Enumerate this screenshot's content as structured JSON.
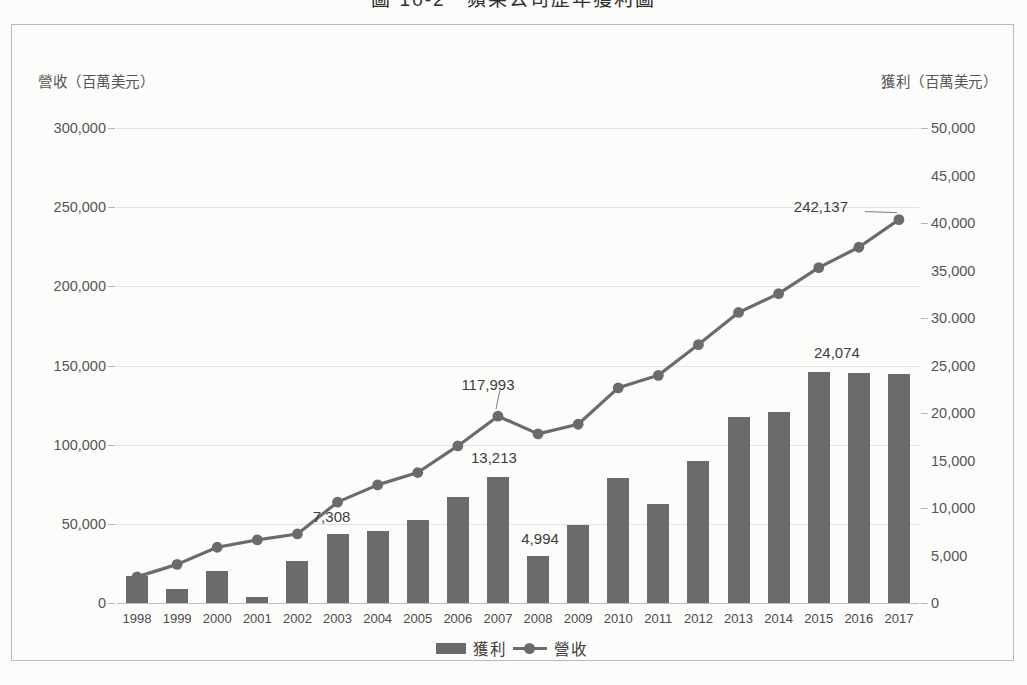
{
  "page": {
    "title_fragment": "圖 10-2　蘋果公司歷年獲利圖"
  },
  "axes": {
    "left_title": "營收（百萬美元）",
    "right_title": "獲利（百萬美元）",
    "left_ticks": [
      "300,000",
      "250,000",
      "200,000",
      "150,000",
      "100,000",
      "50,000",
      "0"
    ],
    "right_ticks": [
      "50,000",
      "45,000",
      "40,000",
      "35,000",
      "30.000",
      "25,000",
      "20,000",
      "15,000",
      "10,000",
      "5,000",
      "0"
    ]
  },
  "legend": {
    "bar_label": "獲利",
    "line_label": "營收"
  },
  "chart_data": {
    "type": "bar",
    "title": "圖 10-2　蘋果公司歷年獲利圖",
    "xlabel": "",
    "ylabel": "營收（百萬美元）",
    "y2label": "獲利（百萬美元）",
    "ylim": [
      0,
      300000
    ],
    "y2lim": [
      0,
      50000
    ],
    "grid": true,
    "legend_position": "bottom",
    "categories": [
      "1998",
      "1999",
      "2000",
      "2001",
      "2002",
      "2003",
      "2004",
      "2005",
      "2006",
      "2007",
      "2008",
      "2009",
      "2010",
      "2011",
      "2012",
      "2013",
      "2014",
      "2015",
      "2016",
      "2017"
    ],
    "series": [
      {
        "name": "獲利",
        "type": "bar",
        "axis": "right",
        "color": "#6b6b6b",
        "values": [
          2800,
          1500,
          3400,
          600,
          4400,
          7308,
          7600,
          8700,
          11200,
          13213,
          4994,
          8200,
          13200,
          10400,
          15000,
          19600,
          20100,
          24300,
          24200,
          24074
        ]
      },
      {
        "name": "營收",
        "type": "line",
        "axis": "left",
        "color": "#6b6b6b",
        "values": [
          16500,
          24400,
          35200,
          39900,
          43600,
          63700,
          74600,
          82400,
          99200,
          117993,
          106800,
          112900,
          135900,
          143800,
          163200,
          183500,
          195400,
          211800,
          224700,
          242137
        ]
      }
    ],
    "data_labels": [
      {
        "series": "獲利",
        "category": "2003",
        "text": "7,308"
      },
      {
        "series": "獲利",
        "category": "2007",
        "text": "13,213"
      },
      {
        "series": "獲利",
        "category": "2008",
        "text": "4,994"
      },
      {
        "series": "獲利",
        "category": "2017",
        "text": "24,074"
      },
      {
        "series": "營收",
        "category": "2007",
        "text": "117,993"
      },
      {
        "series": "營收",
        "category": "2017",
        "text": "242,137"
      }
    ]
  }
}
